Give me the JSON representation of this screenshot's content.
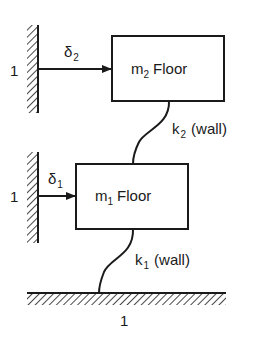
{
  "diagram": {
    "type": "two-story building shear model",
    "colors": {
      "ink": "#1a1a1a",
      "background": "#ffffff"
    },
    "upper_floor": {
      "mass_symbol": "m",
      "mass_subscript": "2",
      "label": "Floor"
    },
    "lower_floor": {
      "mass_symbol": "m",
      "mass_subscript": "1",
      "label": "Floor"
    },
    "springs": [
      {
        "symbol": "k",
        "subscript": "2",
        "note": "(wall)",
        "connects": "m2 to m1"
      },
      {
        "symbol": "k",
        "subscript": "1",
        "note": "(wall)",
        "connects": "m1 to ground"
      }
    ],
    "displacements": [
      {
        "symbol": "δ",
        "subscript": "2",
        "applies_to": "m2"
      },
      {
        "symbol": "δ",
        "subscript": "1",
        "applies_to": "m1"
      }
    ],
    "supports": {
      "upper_wall_label": "1",
      "lower_wall_label": "1",
      "ground_label": "1"
    }
  }
}
